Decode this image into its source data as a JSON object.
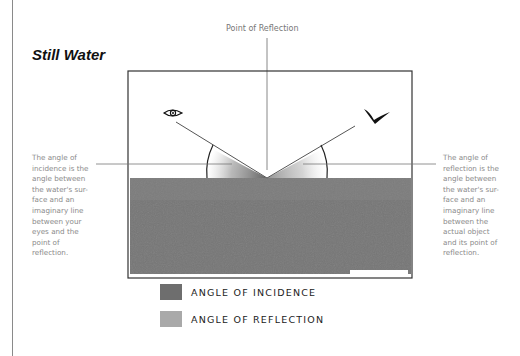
{
  "diagram": {
    "title": "Still Water",
    "point_of_reflection_label": "Point of Reflection",
    "left_note": "The angle of incidence is the angle between the water's sur- face and an imaginary line between your eyes and the point of reflection.",
    "right_note": "The angle of reflection is the angle between the water's sur- face and an imaginary line between the actual object and its point of reflection.",
    "icons": {
      "viewer": "eye-icon",
      "object": "bird-icon"
    },
    "legend": [
      {
        "label": "ANGLE OF INCIDENCE",
        "color": "#6e6e6e"
      },
      {
        "label": "ANGLE OF REFLECTION",
        "color": "#a9a9a9"
      }
    ],
    "colors": {
      "water": "#767676",
      "frame": "#333333",
      "guide_lines": "#555555"
    }
  }
}
